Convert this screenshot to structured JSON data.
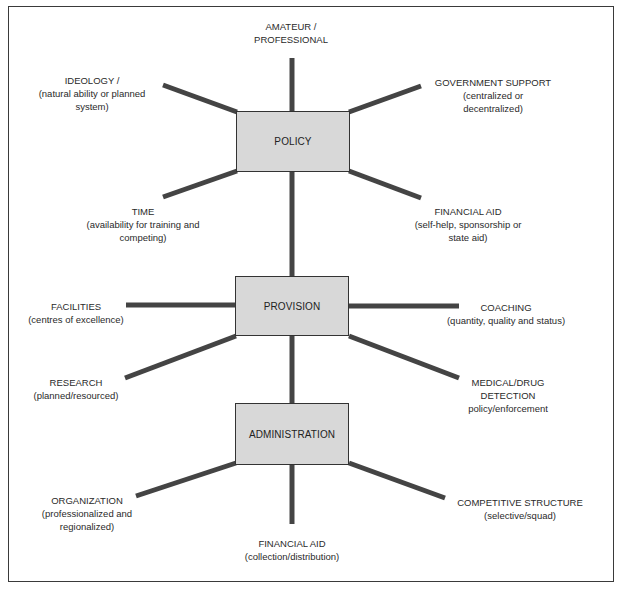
{
  "diagram": {
    "colors": {
      "line": "#444444",
      "node_fill": "#d8d8d8",
      "node_border": "#333333",
      "frame": "#3a3a3a"
    },
    "nodes": {
      "policy": "POLICY",
      "provision": "PROVISION",
      "administration": "ADMINISTRATION"
    },
    "factors": {
      "amateur_professional": {
        "title": "AMATEUR /",
        "sub1": "PROFESSIONAL"
      },
      "ideology": {
        "title": "IDEOLOGY /",
        "sub1": "(natural ability or planned",
        "sub2": "system)"
      },
      "government_support": {
        "title": "GOVERNMENT SUPPORT",
        "sub1": "(centralized or",
        "sub2": "decentralized)"
      },
      "time": {
        "title": "TIME",
        "sub1": "(availability for training and",
        "sub2": "competing)"
      },
      "financial_aid_policy": {
        "title": "FINANCIAL AID",
        "sub1": "(self-help, sponsorship or",
        "sub2": "state aid)"
      },
      "facilities": {
        "title": "FACILITIES",
        "sub1": "(centres of excellence)"
      },
      "coaching": {
        "title": "COACHING",
        "sub1": "(quantity, quality and status)"
      },
      "research": {
        "title": "RESEARCH",
        "sub1": "(planned/resourced)"
      },
      "medical": {
        "title": "MEDICAL/DRUG",
        "sub1": "DETECTION",
        "sub2": "policy/enforcement"
      },
      "organization": {
        "title": "ORGANIZATION",
        "sub1": "(professionalized and",
        "sub2": "regionalized)"
      },
      "competitive_structure": {
        "title": "COMPETITIVE STRUCTURE",
        "sub1": "(selective/squad)"
      },
      "financial_aid_admin": {
        "title": "FINANCIAL AID",
        "sub1": "(collection/distribution)"
      }
    }
  }
}
